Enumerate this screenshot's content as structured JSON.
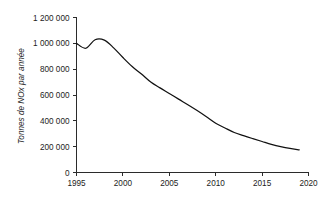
{
  "chart_data": {
    "type": "line",
    "title": "",
    "subtitle": "",
    "xlabel": "",
    "ylabel": "Tonnes de NOx par année",
    "xlim": [
      1995,
      2020
    ],
    "ylim": [
      0,
      1200000
    ],
    "grid": false,
    "legend": false,
    "legend_position": "none",
    "x_ticks": [
      1995,
      2000,
      2005,
      2010,
      2015,
      2020
    ],
    "x_tick_labels": [
      "1995",
      "2000",
      "2005",
      "2010",
      "2015",
      "2020"
    ],
    "y_ticks": [
      0,
      200000,
      400000,
      600000,
      800000,
      1000000,
      1200000
    ],
    "y_tick_labels": [
      "0",
      "200 000",
      "400 000",
      "600 000",
      "800 000",
      "1 000 000",
      "1 200 000"
    ],
    "series": [
      {
        "name": "NOx",
        "color": "#111111",
        "x": [
          1995,
          1996,
          1997,
          1998,
          1999,
          2000,
          2001,
          2002,
          2003,
          2004,
          2005,
          2006,
          2007,
          2008,
          2009,
          2010,
          2011,
          2012,
          2013,
          2014,
          2015,
          2016,
          2017,
          2018,
          2019
        ],
        "values": [
          1000000,
          962000,
          1028000,
          1025000,
          965000,
          890000,
          820000,
          762000,
          700000,
          655000,
          612000,
          568000,
          525000,
          480000,
          432000,
          382000,
          345000,
          310000,
          285000,
          262000,
          240000,
          218000,
          200000,
          186000,
          176000
        ]
      }
    ]
  },
  "axes": {
    "y_axis_title": "Tonnes de NOx par année"
  }
}
